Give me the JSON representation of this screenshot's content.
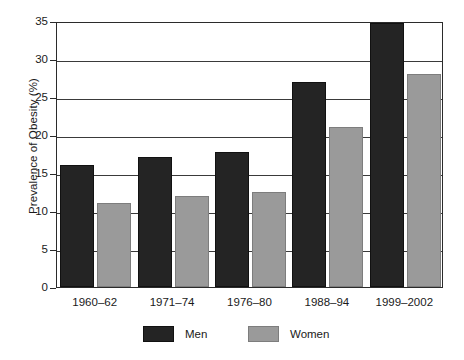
{
  "chart_data": {
    "type": "bar",
    "title": "",
    "xlabel": "",
    "ylabel": "Prevalence of Obesity (%)",
    "categories": [
      "1960–62",
      "1971–74",
      "1976–80",
      "1988–94",
      "1999–2002"
    ],
    "series": [
      {
        "name": "Men",
        "color": "#242424",
        "values": [
          16.1,
          17.1,
          17.8,
          27.0,
          34.8
        ]
      },
      {
        "name": "Women",
        "color": "#9a9a9a",
        "values": [
          11.0,
          12.0,
          12.5,
          21.0,
          28.0
        ]
      }
    ],
    "ylim": [
      0,
      35
    ],
    "yticks": [
      0,
      5,
      10,
      15,
      20,
      25,
      30,
      35
    ],
    "ytick_labels": [
      "0",
      "5",
      "10",
      "15",
      "20",
      "25",
      "30",
      "35"
    ],
    "grid": "horizontal",
    "legend_position": "bottom-center",
    "legend_entries": [
      "Men",
      "Women"
    ]
  }
}
